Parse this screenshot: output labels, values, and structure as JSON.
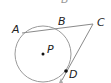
{
  "diagram": {
    "type": "circle-secant-tangent",
    "circle": {
      "center_label": "P",
      "cx": 43,
      "cy": 54,
      "r": 28
    },
    "points": {
      "A": {
        "label": "A",
        "x": 22,
        "y": 33
      },
      "B": {
        "label": "B",
        "x": 58,
        "y": 28
      },
      "C": {
        "label": "C",
        "x": 93,
        "y": 24
      },
      "D": {
        "label": "D",
        "x": 66,
        "y": 71
      },
      "P": {
        "label": "P",
        "x": 43,
        "y": 54
      }
    },
    "segments": [
      {
        "from": "A",
        "to": "C",
        "kind": "secant"
      },
      {
        "from": "C",
        "to": "D",
        "kind": "tangent"
      }
    ],
    "top_cut_label": "B",
    "colors": {
      "stroke": "#9a9a9a",
      "point": "#111111",
      "text": "#222222"
    }
  }
}
